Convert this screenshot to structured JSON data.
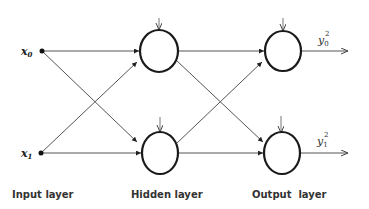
{
  "diagram": {
    "inputs": [
      {
        "symbol": "x",
        "subscript": "0"
      },
      {
        "symbol": "x",
        "subscript": "1"
      }
    ],
    "outputs": [
      {
        "symbol": "y",
        "subscript": "0",
        "superscript": "2"
      },
      {
        "symbol": "y",
        "subscript": "1",
        "superscript": "2"
      }
    ],
    "layers": [
      {
        "label": "Input layer"
      },
      {
        "label": "Hidden layer"
      },
      {
        "label": "Output  layer"
      }
    ],
    "colors": {
      "node_stroke": "#1a1a1a",
      "edge": "#555555",
      "background": "#ffffff"
    }
  }
}
